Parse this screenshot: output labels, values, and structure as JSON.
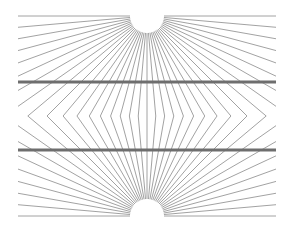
{
  "figure": {
    "title": "Hering illusion",
    "colors": {
      "background": "#ffffff",
      "ray": "#8a8a8a",
      "bar": "#6e6e6e"
    },
    "bounds": {
      "left": 18,
      "right": 276,
      "top": 16,
      "bottom": 216
    },
    "centers": [
      {
        "x": 147,
        "y": 16
      },
      {
        "x": 147,
        "y": 216
      }
    ],
    "radius": 17,
    "mirror_y": 116,
    "ray_count": 36,
    "bars": [
      {
        "y": 82,
        "width": 3
      },
      {
        "y": 150,
        "width": 3
      }
    ]
  }
}
